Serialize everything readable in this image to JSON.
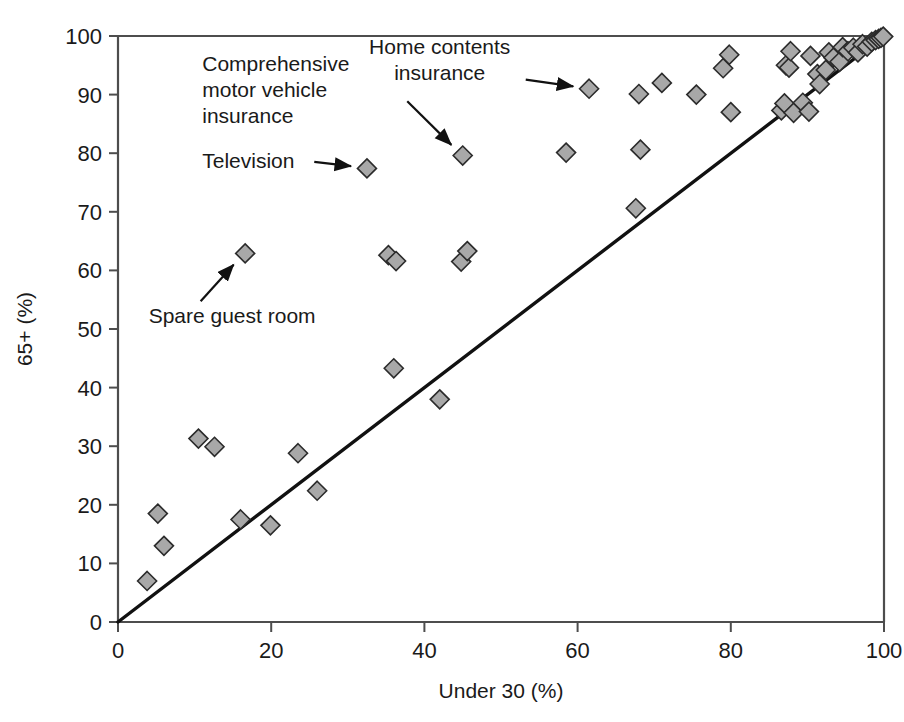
{
  "figure": {
    "title": "",
    "background": "#ffffff",
    "marker_fill": "#a8a8a8",
    "marker_stroke": "#2b2b2b",
    "axis_color": "#4d4d4d",
    "line_color": "#111111"
  },
  "axes": {
    "x": {
      "label": "Under 30 (%)",
      "min": 0,
      "max": 100,
      "ticks": [
        0,
        20,
        40,
        60,
        80,
        100
      ],
      "tick_labels": [
        "0",
        "20",
        "40",
        "60",
        "80",
        "100"
      ]
    },
    "y": {
      "label": "65+ (%)",
      "min": 0,
      "max": 100,
      "ticks": [
        0,
        10,
        20,
        30,
        40,
        50,
        60,
        70,
        80,
        90,
        100
      ],
      "tick_labels": [
        "0",
        "10",
        "20",
        "30",
        "40",
        "50",
        "60",
        "70",
        "80",
        "90",
        "100"
      ]
    }
  },
  "annotations": [
    {
      "id": "home-contents-insurance",
      "lines": [
        "Home contents",
        "insurance"
      ],
      "text_x": 42,
      "text_y": 97,
      "align": "middle",
      "target": [
        61.5,
        91.0
      ]
    },
    {
      "id": "comprehensive-motor-vehicle-insurance",
      "lines": [
        "Comprehensive",
        "motor vehicle",
        "insurance"
      ],
      "text_x": 11,
      "text_y": 94,
      "align": "start",
      "target": [
        45.0,
        79.5
      ]
    },
    {
      "id": "television",
      "lines": [
        "Television"
      ],
      "text_x": 11,
      "text_y": 77.5,
      "align": "start",
      "target": [
        32.5,
        77.5
      ]
    },
    {
      "id": "spare-guest-room",
      "lines": [
        "Spare guest room"
      ],
      "text_x": 4,
      "text_y": 51,
      "align": "start",
      "target": [
        16.5,
        63.0
      ]
    }
  ],
  "chart_data": {
    "type": "scatter",
    "title": "",
    "xlabel": "Under 30 (%)",
    "ylabel": "65+ (%)",
    "xlim": [
      0,
      100
    ],
    "ylim": [
      0,
      100
    ],
    "grid": false,
    "legend": "none",
    "reference_line": {
      "name": "y = x equality line",
      "from": [
        0,
        0
      ],
      "to": [
        100,
        100
      ]
    },
    "series": [
      {
        "name": "Household items and services",
        "marker": "diamond",
        "points": [
          [
            3.8,
            7.0
          ],
          [
            5.2,
            18.5
          ],
          [
            6.0,
            13.0
          ],
          [
            10.5,
            31.3
          ],
          [
            12.6,
            29.9
          ],
          [
            16.0,
            17.5
          ],
          [
            16.6,
            62.9
          ],
          [
            19.9,
            16.5
          ],
          [
            23.5,
            28.8
          ],
          [
            26.0,
            22.4
          ],
          [
            32.5,
            77.4
          ],
          [
            35.3,
            62.6
          ],
          [
            36.3,
            61.6
          ],
          [
            36.0,
            43.3
          ],
          [
            42.0,
            38.0
          ],
          [
            45.0,
            79.6
          ],
          [
            44.8,
            61.5
          ],
          [
            45.6,
            63.3
          ],
          [
            58.5,
            80.1
          ],
          [
            61.5,
            91.0
          ],
          [
            67.6,
            70.6
          ],
          [
            68.2,
            80.6
          ],
          [
            68.0,
            90.1
          ],
          [
            71.0,
            92.0
          ],
          [
            75.5,
            90.0
          ],
          [
            79.0,
            94.5
          ],
          [
            79.8,
            96.8
          ],
          [
            80.0,
            87.0
          ],
          [
            86.6,
            87.3
          ],
          [
            87.0,
            88.5
          ],
          [
            87.2,
            95.0
          ],
          [
            87.6,
            94.6
          ],
          [
            87.8,
            97.4
          ],
          [
            88.2,
            86.9
          ],
          [
            89.4,
            88.6
          ],
          [
            90.2,
            87.1
          ],
          [
            90.4,
            96.6
          ],
          [
            91.3,
            93.5
          ],
          [
            91.6,
            91.8
          ],
          [
            92.4,
            94.2
          ],
          [
            92.8,
            97.2
          ],
          [
            93.4,
            96.3
          ],
          [
            94.2,
            95.6
          ],
          [
            94.6,
            98.1
          ],
          [
            95.3,
            97.4
          ],
          [
            96.0,
            98.0
          ],
          [
            96.6,
            97.2
          ],
          [
            97.2,
            98.6
          ],
          [
            97.8,
            98.2
          ],
          [
            98.4,
            99.0
          ],
          [
            98.9,
            99.3
          ],
          [
            99.3,
            99.5
          ],
          [
            99.6,
            99.7
          ],
          [
            99.9,
            99.9
          ]
        ]
      }
    ]
  }
}
